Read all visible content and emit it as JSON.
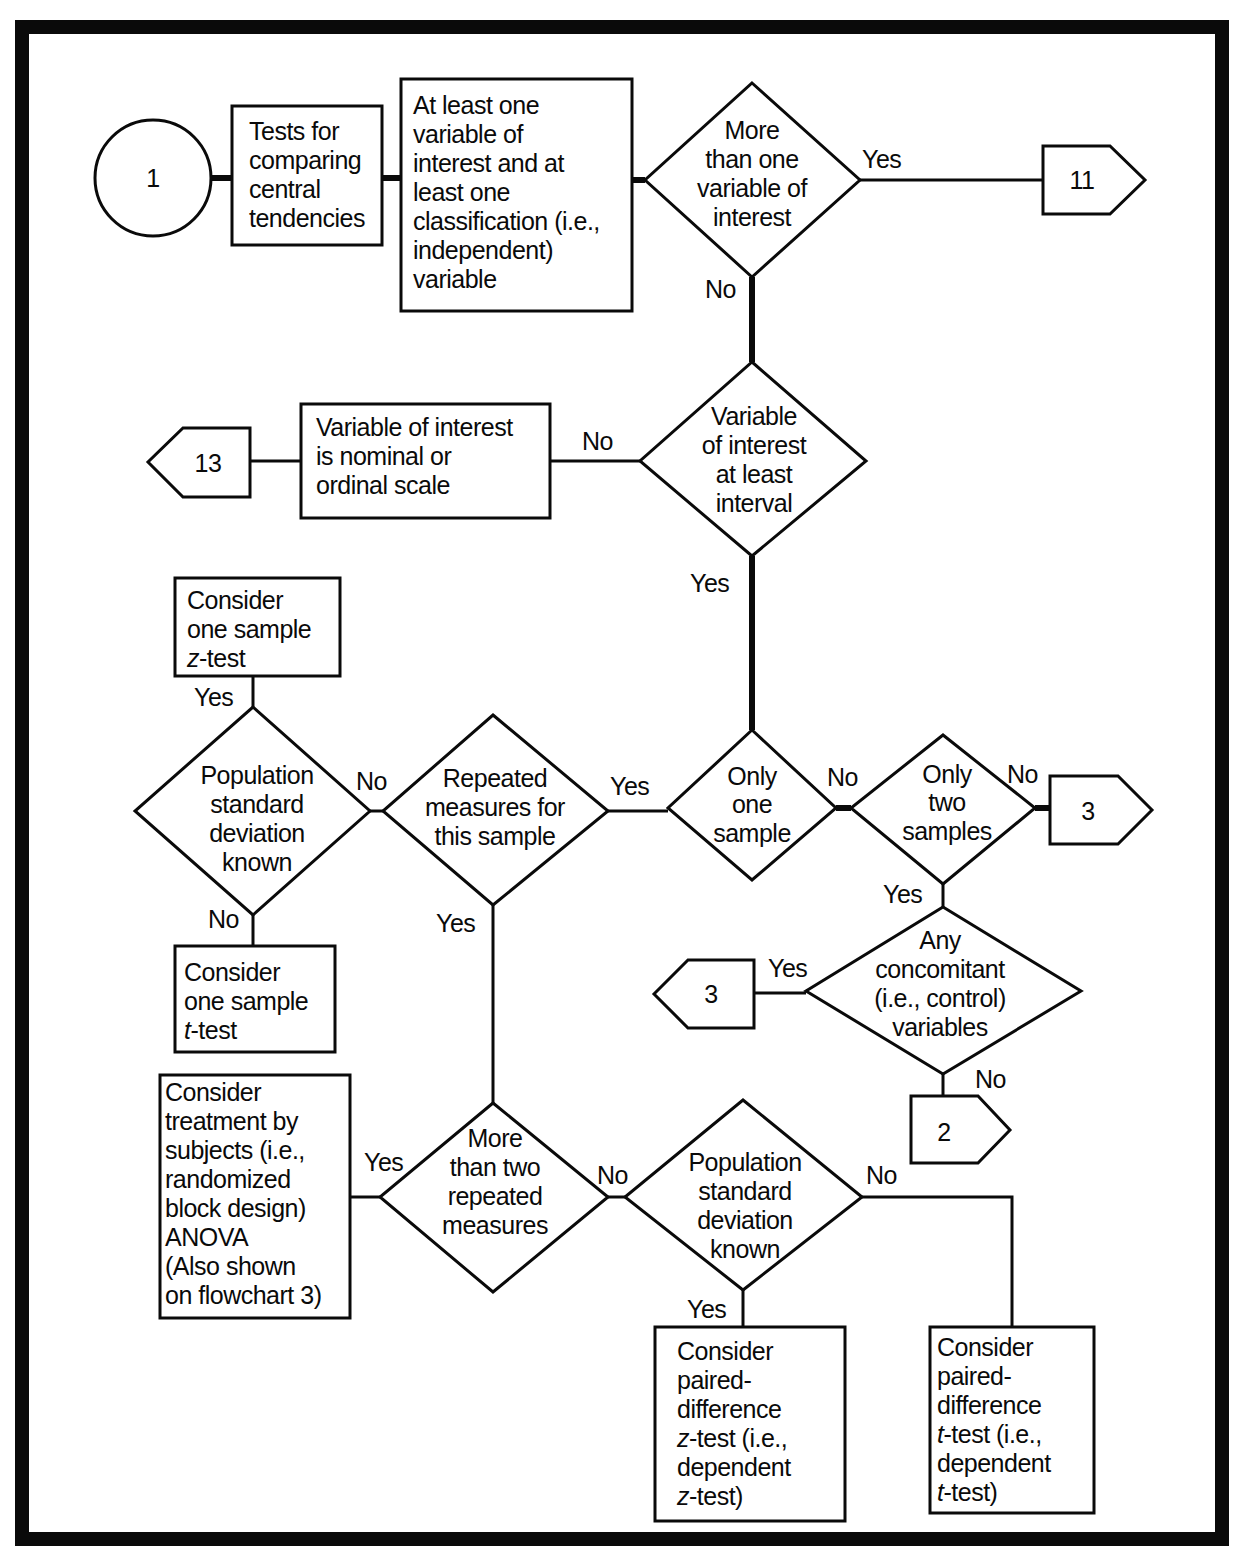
{
  "colors": {
    "ink": "#0a0a0a",
    "paper": "#ffffff"
  },
  "start": {
    "label": "1"
  },
  "boxes": {
    "tests_for": [
      "Tests for",
      "comparing",
      "central",
      "tendencies"
    ],
    "at_least_one": [
      "At least one",
      "variable of",
      "interest and at",
      "least one",
      "classification (i.e.,",
      "independent)",
      "variable"
    ],
    "nominal": [
      "Variable of interest",
      "is nominal or",
      "ordinal scale"
    ],
    "one_sample_z": {
      "line1": "Consider",
      "line2": "one sample",
      "italic": "z",
      "rest": "-test"
    },
    "one_sample_t": {
      "line1": "Consider",
      "line2": "one sample",
      "italic": "t",
      "rest": "-test"
    },
    "treatment": [
      "Consider",
      "treatment by",
      "subjects (i.e.,",
      "randomized",
      "block design)",
      "ANOVA",
      "(Also shown",
      "on flowchart 3)"
    ],
    "paired_z": {
      "lines": [
        "Consider",
        "paired-",
        "difference"
      ],
      "italic": "z",
      "line4_rest": "-test (i.e.,",
      "line5": "dependent",
      "line6_rest": "-test)"
    },
    "paired_t": {
      "lines": [
        "Consider",
        "paired-",
        "difference"
      ],
      "italic": "t",
      "line4_rest": "-test (i.e.,",
      "line5": "dependent",
      "line6_rest": "-test)"
    }
  },
  "decisions": {
    "more_than_one_var": [
      "More",
      "than one",
      "variable of",
      "interest"
    ],
    "at_least_interval": [
      "Variable",
      "of interest",
      "at least",
      "interval"
    ],
    "only_one_sample": [
      "Only",
      "one",
      "sample"
    ],
    "only_two_samples": [
      "Only",
      "two",
      "samples"
    ],
    "concomitant": [
      "Any",
      "concomitant",
      "(i.e., control)",
      "variables"
    ],
    "repeated_measures": [
      "Repeated",
      "measures for",
      "this sample"
    ],
    "pop_sd_known_left": [
      "Population",
      "standard",
      "deviation",
      "known"
    ],
    "more_than_two_repeated": [
      "More",
      "than two",
      "repeated",
      "measures"
    ],
    "pop_sd_known_right": [
      "Population",
      "standard",
      "deviation",
      "known"
    ]
  },
  "connectors": {
    "to_11": "11",
    "to_13": "13",
    "to_3_right": "3",
    "to_3_left": "3",
    "to_2": "2"
  },
  "branch_labels": {
    "yes": "Yes",
    "no": "No"
  }
}
